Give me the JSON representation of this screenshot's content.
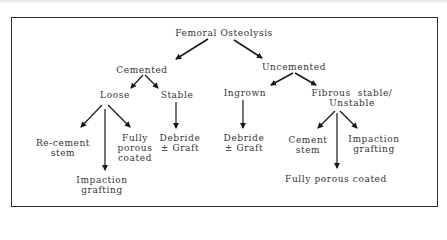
{
  "diagram": {
    "root": "Femoral  Osteolysis",
    "branches": {
      "cemented": {
        "label": "Cemented",
        "loose": {
          "label": "Loose",
          "options": {
            "recement": "Re-cement\nstem",
            "impaction": "Impaction\ngrafting",
            "fully_porous": "Fully\nporous\ncoated"
          }
        },
        "stable": {
          "label": "Stable",
          "options": {
            "debride": "Debride\n± Graft"
          }
        }
      },
      "uncemented": {
        "label": "Uncemented",
        "ingrown": {
          "label": "Ingrown",
          "options": {
            "debride": "Debride\n± Graft"
          }
        },
        "fibrous": {
          "label": "Fibrous  stable/\nUnstable",
          "options": {
            "cement_stem": "Cement\nstem",
            "fully_porous": "Fully  porous  coated",
            "impaction": "Impaction\ngrafting"
          }
        }
      }
    },
    "colors": {
      "line": "#1a1a1a",
      "text": "#333333",
      "border": "#2e2e2e"
    }
  },
  "caption": ""
}
